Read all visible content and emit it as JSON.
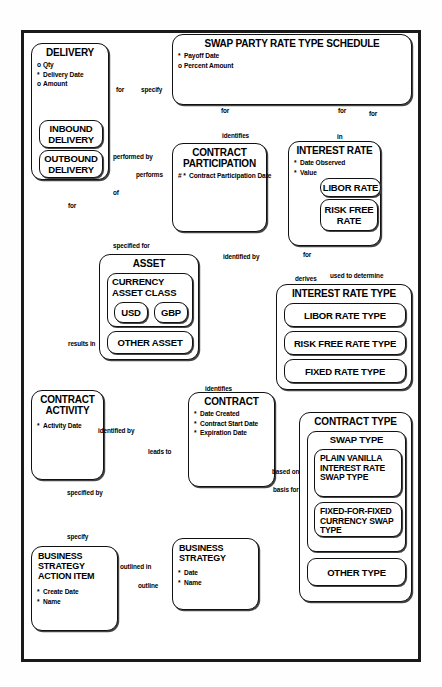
{
  "diagram": {
    "notation": "barker-erd",
    "frame_border_color": "#1a1a1a",
    "background_color": "#ffffff",
    "entity_border_color": "#111111"
  },
  "entities": {
    "delivery": {
      "name": "DELIVERY",
      "attributes": [
        {
          "mark": "o",
          "label": "Qty"
        },
        {
          "mark": "*",
          "label": "Delivery Date"
        },
        {
          "mark": "o",
          "label": "Amount"
        }
      ],
      "subtypes": [
        {
          "name": "INBOUND DELIVERY"
        },
        {
          "name": "OUTBOUND DELIVERY"
        }
      ]
    },
    "swap_party_rate_type_schedule": {
      "name": "SWAP PARTY RATE TYPE SCHEDULE",
      "attributes": [
        {
          "mark": "*",
          "label": "Payoff Date"
        },
        {
          "mark": "o",
          "label": "Percent Amount"
        }
      ]
    },
    "contract_participation": {
      "name": "CONTRACT PARTICIPATION",
      "attributes": [
        {
          "mark": "# *",
          "label": "Contract Participation Date"
        }
      ]
    },
    "interest_rate": {
      "name": "INTEREST RATE",
      "attributes": [
        {
          "mark": "*",
          "label": "Date Observed"
        },
        {
          "mark": "*",
          "label": "Value"
        }
      ],
      "subtypes": [
        {
          "name": "LIBOR RATE"
        },
        {
          "name": "RISK FREE RATE"
        }
      ]
    },
    "asset": {
      "name": "ASSET",
      "subtypes": [
        {
          "name": "CURRENCY ASSET CLASS",
          "subtypes": [
            {
              "name": "USD"
            },
            {
              "name": "GBP"
            }
          ]
        },
        {
          "name": "OTHER ASSET"
        }
      ]
    },
    "interest_rate_type": {
      "name": "INTEREST RATE TYPE",
      "subtypes": [
        {
          "name": "LIBOR RATE TYPE"
        },
        {
          "name": "RISK FREE RATE TYPE"
        },
        {
          "name": "FIXED RATE TYPE"
        }
      ]
    },
    "contract_activity": {
      "name": "CONTRACT ACTIVITY",
      "attributes": [
        {
          "mark": "*",
          "label": "Activity Date"
        }
      ]
    },
    "contract": {
      "name": "CONTRACT",
      "attributes": [
        {
          "mark": "*",
          "label": "Date Created"
        },
        {
          "mark": "*",
          "label": "Contract Start Date"
        },
        {
          "mark": "*",
          "label": "Expiration Date"
        }
      ]
    },
    "contract_type": {
      "name": "CONTRACT TYPE",
      "subtypes": [
        {
          "name": "SWAP TYPE",
          "subtypes": [
            {
              "name": "PLAIN VANILLA INTEREST RATE SWAP TYPE"
            },
            {
              "name": "FIXED-FOR-FIXED CURRENCY SWAP TYPE"
            }
          ]
        },
        {
          "name": "OTHER TYPE"
        }
      ]
    },
    "business_strategy_action_item": {
      "name": "BUSINESS STRATEGY ACTION ITEM",
      "attributes": [
        {
          "mark": "*",
          "label": "Create Date"
        },
        {
          "mark": "*",
          "label": "Name"
        }
      ]
    },
    "business_strategy": {
      "name": "BUSINESS STRATEGY",
      "attributes": [
        {
          "mark": "*",
          "label": "Date"
        },
        {
          "mark": "*",
          "label": "Name"
        }
      ]
    }
  },
  "relationship_labels": {
    "delivery_for": "for",
    "schedule_specify": "specify",
    "delivery_performed_by": "performed by",
    "participation_performs": "performs",
    "schedule_for_participation": "for",
    "schedule_for_interest_rate": "for",
    "schedule_for_rate_type": "for",
    "participation_identifies": "identifies",
    "interest_rate_in": "in",
    "delivery_of": "of",
    "asset_specified_for": "specified for",
    "delivery_for_activity": "for",
    "activity_results_in": "results in",
    "asset_identified_by": "identified by",
    "contract_identifies": "identifies",
    "activity_identified_by": "identified by",
    "contract_leads_to": "leads to",
    "interest_rate_for": "for",
    "rate_type_derives": "derives",
    "rate_type_used_to_determine": "used to determine",
    "contract_based_on": "based on",
    "contract_type_basis_for": "basis for",
    "activity_specified_by": "specified by",
    "action_item_specify": "specify",
    "action_item_outlined_in": "outlined in",
    "strategy_outline": "outline"
  }
}
